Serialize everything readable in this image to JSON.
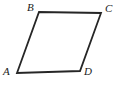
{
  "figure": {
    "type": "parallelogram",
    "shape_name": "quadrilateral-ABCD",
    "background_color": "#ffffff",
    "stroke_color": "#262626",
    "stroke_width": 1.8,
    "label_color": "#1a1a1a",
    "label_font_style": "italic serif",
    "label_font_size": 11,
    "vertices": [
      {
        "id": "A",
        "label": "A",
        "position_role": "bottom-left",
        "x": 17,
        "y": 73,
        "label_x": 3,
        "label_y": 66
      },
      {
        "id": "B",
        "label": "B",
        "position_role": "top-left",
        "x": 39,
        "y": 12,
        "label_x": 27,
        "label_y": 2
      },
      {
        "id": "C",
        "label": "C",
        "position_role": "top-right",
        "x": 101,
        "y": 13,
        "label_x": 105,
        "label_y": 3
      },
      {
        "id": "D",
        "label": "D",
        "position_role": "bottom-right",
        "x": 80,
        "y": 71,
        "label_x": 84,
        "label_y": 66
      }
    ],
    "edges": [
      {
        "id": "AB",
        "from": "A",
        "to": "B",
        "name": "left-side"
      },
      {
        "id": "BC",
        "from": "B",
        "to": "C",
        "name": "top-side"
      },
      {
        "id": "CD",
        "from": "C",
        "to": "D",
        "name": "right-side"
      },
      {
        "id": "DA",
        "from": "D",
        "to": "A",
        "name": "bottom-side"
      }
    ],
    "path_points": "17,73 39,12 101,13 80,71",
    "labels": {
      "A": "A",
      "B": "B",
      "C": "C",
      "D": "D"
    }
  },
  "canvas": {
    "width": 119,
    "height": 85
  }
}
